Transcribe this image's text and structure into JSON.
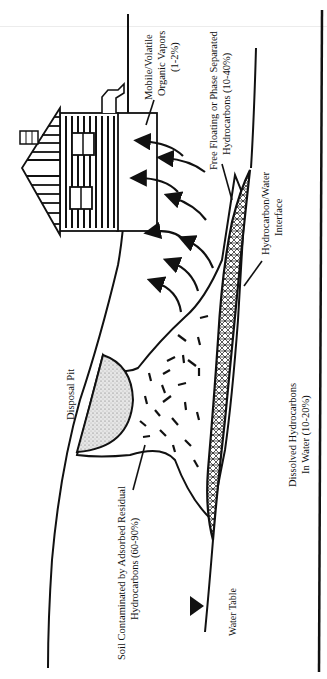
{
  "diagram": {
    "orientation": "rotated 90 degrees counter-clockwise",
    "colors": {
      "ink": "#111111",
      "background": "#ffffff",
      "pit_fill": "#d9d9d9"
    },
    "labels": {
      "vapors_line1": "Mobile/Volatile",
      "vapors_line2": "Organic Vapors",
      "vapors_line3": "(1-2%)",
      "free_floating_line1": "Free Floating or Phase Separated",
      "free_floating_line2": "Hydrocarbons (10-40%)",
      "interface_line1": "Hydrocarbon/Water",
      "interface_line2": "Interface",
      "disposal_pit": "Disposal Pit",
      "soil_line1": "Soil Contaminated by Adsorbed Residual",
      "soil_line2": "Hydrocarbons (60-90%)",
      "dissolved_line1": "Dissolved Hydrocarbons",
      "dissolved_line2": "In Water (10-20%)",
      "water_table": "Water Table"
    },
    "components": [
      {
        "name": "house",
        "icon": "house-icon"
      },
      {
        "name": "vapor-arrows",
        "count": 8
      },
      {
        "name": "ground-surface"
      },
      {
        "name": "disposal-pit"
      },
      {
        "name": "contaminated-soil-plume"
      },
      {
        "name": "free-product-lens"
      },
      {
        "name": "water-table-line",
        "icon": "water-table-triangle-icon"
      },
      {
        "name": "aquifer-boundary"
      }
    ]
  }
}
